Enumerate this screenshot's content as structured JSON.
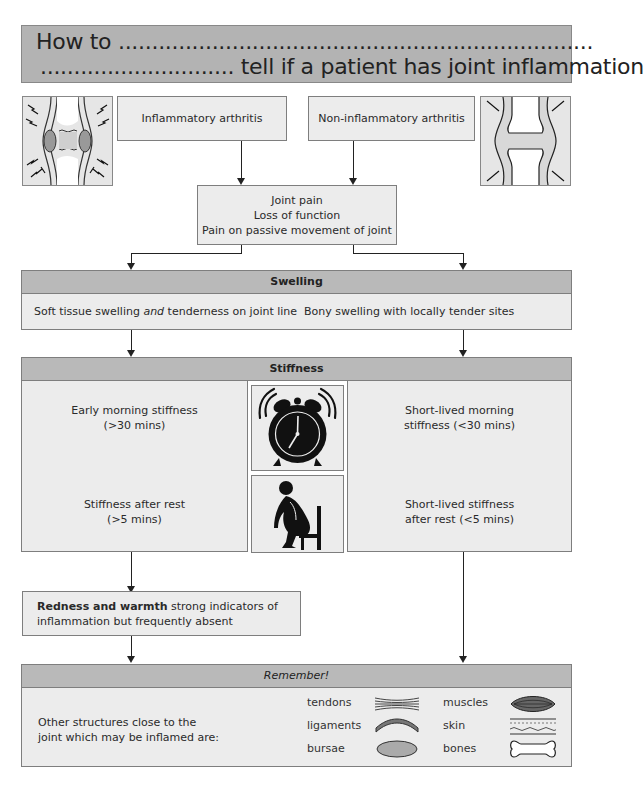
{
  "title": {
    "line1": "How to .......................................................................",
    "line2": "............................. tell if a patient has joint inflammation"
  },
  "top": {
    "inflammatory": "Inflammatory arthritis",
    "non_inflammatory": "Non-inflammatory arthritis",
    "symptoms": [
      "Joint pain",
      "Loss of function",
      "Pain on passive movement of joint"
    ]
  },
  "swelling": {
    "header": "Swelling",
    "left_pre": "Soft tissue swelling ",
    "left_em": "and",
    "left_post": " tenderness on joint line",
    "right": "Bony swelling with locally tender sites"
  },
  "stiffness": {
    "header": "Stiffness",
    "left_top": [
      "Early morning stiffness",
      "(>30 mins)"
    ],
    "left_bottom": [
      "Stiffness after rest",
      "(>5 mins)"
    ],
    "right_top": [
      "Short-lived morning",
      "stiffness (<30 mins)"
    ],
    "right_bottom": [
      "Short-lived stiffness",
      "after rest (<5 mins)"
    ],
    "icons": [
      "alarm-clock-icon",
      "sitting-person-icon"
    ]
  },
  "redness": {
    "bold": "Redness and warmth",
    "rest1": " strong indicators of",
    "line2": "inflammation but frequently absent"
  },
  "remember": {
    "header": "Remember!",
    "intro": [
      "Other structures close to the",
      "joint which may be inflamed are:"
    ],
    "structures": [
      {
        "label": "tendons",
        "icon": "tendons-icon"
      },
      {
        "label": "ligaments",
        "icon": "ligaments-icon"
      },
      {
        "label": "bursae",
        "icon": "bursae-icon"
      },
      {
        "label": "muscles",
        "icon": "muscles-icon"
      },
      {
        "label": "skin",
        "icon": "skin-icon"
      },
      {
        "label": "bones",
        "icon": "bones-icon"
      }
    ]
  },
  "colors": {
    "header_gray": "#b9b9b9",
    "box_light": "#ececec",
    "border": "#7e7e7e"
  }
}
